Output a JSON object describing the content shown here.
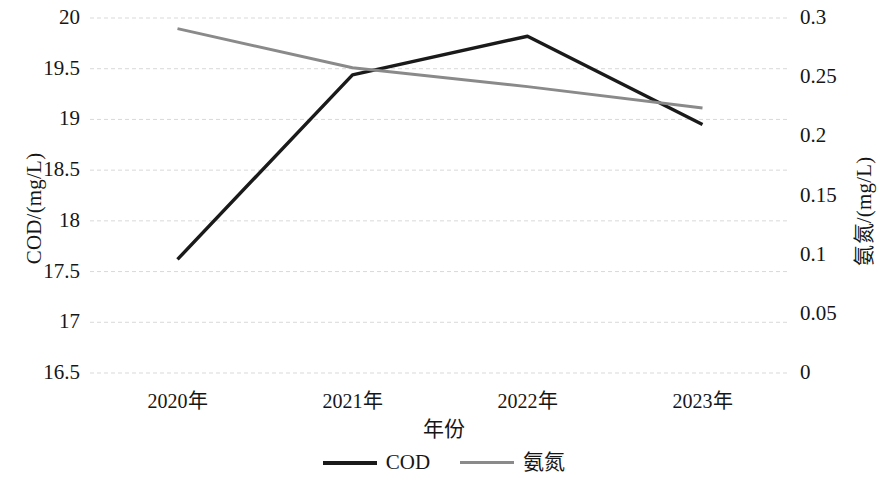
{
  "chart_data": {
    "type": "line",
    "title": "",
    "xlabel": "年份",
    "categories": [
      "2020年",
      "2021年",
      "2022年",
      "2023年"
    ],
    "grid": true,
    "legend_position": "bottom",
    "axes": {
      "left": {
        "label": "COD/(mg/L)",
        "ylim": [
          16.5,
          20
        ],
        "ticks": [
          "20",
          "19.5",
          "19",
          "18.5",
          "18",
          "17.5",
          "17",
          "16.5"
        ],
        "tick_values": [
          20,
          19.5,
          19,
          18.5,
          18,
          17.5,
          17,
          16.5
        ]
      },
      "right": {
        "label": "氨氮/(mg/L)",
        "ylim": [
          0,
          0.3
        ],
        "ticks": [
          "0.3",
          "0.25",
          "0.2",
          "0.15",
          "0.1",
          "0.05",
          "0"
        ],
        "tick_values": [
          0.3,
          0.25,
          0.2,
          0.15,
          0.1,
          0.05,
          0
        ]
      }
    },
    "series": [
      {
        "name": "COD",
        "axis": "left",
        "color": "#1a1a1a",
        "width": 3.4,
        "values": [
          17.62,
          19.44,
          19.82,
          18.95
        ]
      },
      {
        "name": "氨氮",
        "axis": "right",
        "color": "#8a8a8a",
        "width": 3.0,
        "values": [
          0.291,
          0.258,
          0.242,
          0.224
        ]
      }
    ]
  },
  "legend": {
    "items": [
      {
        "label": "COD",
        "color": "#1a1a1a",
        "width": 4
      },
      {
        "label": "氨氮",
        "color": "#8a8a8a",
        "width": 3
      }
    ]
  },
  "ticks": {
    "left": [
      "20",
      "19.5",
      "19",
      "18.5",
      "18",
      "17.5",
      "17",
      "16.5"
    ],
    "right": [
      "0.3",
      "0.25",
      "0.2",
      "0.15",
      "0.1",
      "0.05",
      "0"
    ],
    "x": [
      "2020年",
      "2021年",
      "2022年",
      "2023年"
    ]
  },
  "titles": {
    "y_left": "COD/(mg/L)",
    "y_right": "氨氮/(mg/L)",
    "x": "年份"
  }
}
